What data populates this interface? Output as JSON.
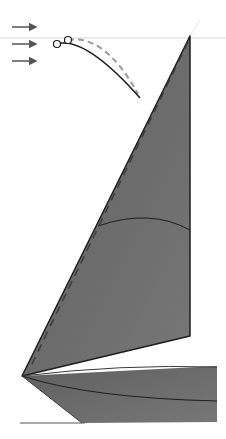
{
  "diagram": {
    "type": "sail-twist-illustration",
    "colors": {
      "background": "#ffffff",
      "sail_fill": "#6b6b6b",
      "outline": "#1e1e1e",
      "dashed_line": "#444444",
      "curve_dashed": "#9a9a9a",
      "arrow": "#555555",
      "horizon_line": "#d4d4d4",
      "baseline": "#555555"
    },
    "wind_arrows": [
      {
        "x1": 12,
        "y1": 27,
        "x2": 38,
        "y2": 27
      },
      {
        "x1": 12,
        "y1": 44,
        "x2": 38,
        "y2": 44
      },
      {
        "x1": 12,
        "y1": 61,
        "x2": 38,
        "y2": 61
      }
    ],
    "mast_top": {
      "x": 190,
      "y": 36
    },
    "tack": {
      "x": 22,
      "y": 376
    },
    "mainsail": {
      "points": "190,36 190,336 22,376"
    },
    "foot_sail": {
      "points": "22,376 217,366 217,422 82,423"
    },
    "section_curve": "M98,226 Q150,208 190,230",
    "foot_curve": "M22,376 Q90,398 217,401",
    "twist_curve_solid": "M57,44 Q85,36 140,98",
    "twist_curve_dashed": "M68,40 Q105,34 138,94",
    "twist_circles": [
      {
        "cx": 57,
        "cy": 44,
        "r": 3.5
      },
      {
        "cx": 68,
        "cy": 40,
        "r": 3.5
      }
    ]
  }
}
